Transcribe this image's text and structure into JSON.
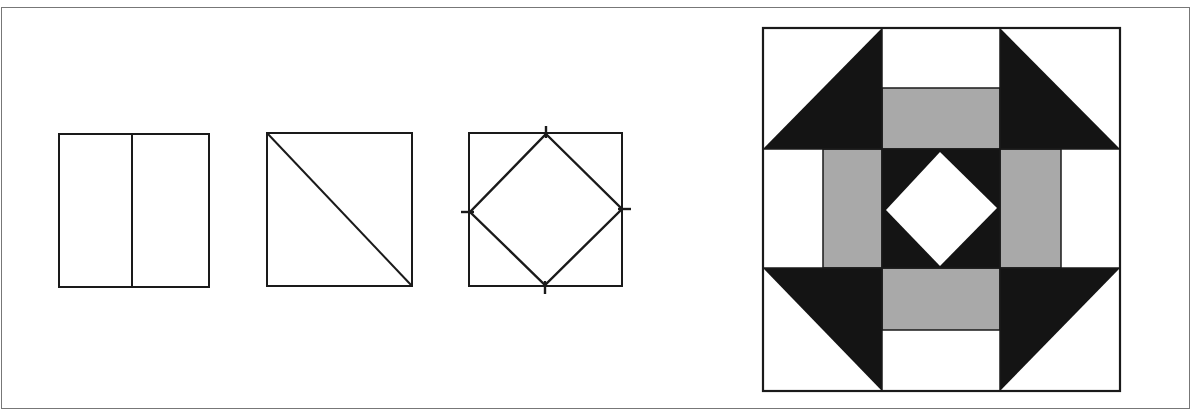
{
  "figure": {
    "colors": {
      "background": "#ffffff",
      "line": "#1a1a1a",
      "frame": "#777777",
      "dark_fabric": "#141414",
      "medium_fabric": "#a9a9a9",
      "light_fabric": "#ffffff"
    },
    "panels": [
      {
        "id": "square-halved",
        "label": "Square divided into two rectangles"
      },
      {
        "id": "square-diagonal",
        "label": "Square cut diagonally into two triangles"
      },
      {
        "id": "square-in-square",
        "label": "Diamond set in square (square-in-a-square) with midpoint marks"
      },
      {
        "id": "finished-block",
        "label": "Finished quilt block (Churn Dash / Monkey Wrench style with center diamond)"
      }
    ]
  }
}
